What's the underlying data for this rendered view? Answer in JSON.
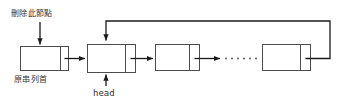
{
  "diagram": {
    "background_color": "#ffffff",
    "stroke_color": "#4d4d4d",
    "arrow_color": "#1a1a1a",
    "labels": {
      "delete_node": "刪除此節點",
      "original_head": "原串列首",
      "head_pointer": "head"
    },
    "nodes": [
      {
        "id": "node-1",
        "data_label": "",
        "pointer_label": "",
        "x": 20,
        "y": 46,
        "data_w": 40,
        "ptr_w": 8,
        "h": 24
      },
      {
        "id": "node-2",
        "data_label": "",
        "pointer_label": "",
        "x": 87,
        "y": 44,
        "data_w": 38,
        "ptr_w": 10,
        "h": 28
      },
      {
        "id": "node-3",
        "data_label": "",
        "pointer_label": "",
        "x": 155,
        "y": 44,
        "data_w": 34,
        "ptr_w": 10,
        "h": 26
      },
      {
        "id": "node-last",
        "data_label": "",
        "pointer_label": "",
        "x": 262,
        "y": 44,
        "data_w": 38,
        "ptr_w": 10,
        "h": 26
      }
    ],
    "ellipsis": {
      "dot_count": 6,
      "x_start": 224,
      "y": 58
    },
    "edges": [
      {
        "id": "edge-delete-arrow",
        "from": "delete-label",
        "to": "node-1",
        "kind": "vertical-arrow"
      },
      {
        "id": "edge-n1-n2",
        "from": "node-1",
        "to": "node-2",
        "kind": "horizontal-arrow"
      },
      {
        "id": "edge-n2-n3",
        "from": "node-2",
        "to": "node-3",
        "kind": "horizontal-arrow"
      },
      {
        "id": "edge-n3-ellipsis",
        "from": "node-3",
        "to": "ellipsis",
        "kind": "horizontal-arrow"
      },
      {
        "id": "edge-ellipsis-last",
        "from": "ellipsis",
        "to": "node-last",
        "kind": "horizontal-arrow"
      },
      {
        "id": "edge-head-arrow",
        "from": "head-label",
        "to": "node-2",
        "kind": "vertical-arrow-up"
      },
      {
        "id": "edge-wraparound",
        "from": "node-last",
        "to": "node-2",
        "kind": "routed-return-arrow"
      }
    ]
  }
}
